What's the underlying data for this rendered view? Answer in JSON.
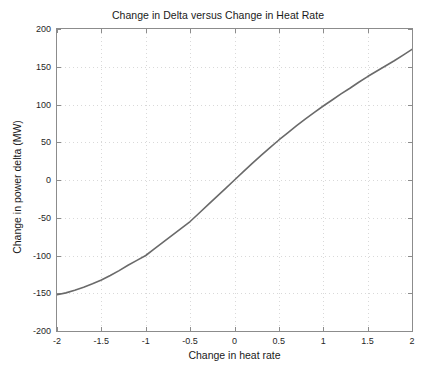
{
  "chart_data": {
    "type": "line",
    "title": "Change in Delta versus Change in Heat Rate",
    "xlabel": "Change in heat rate",
    "ylabel": "Change in power delta (MW)",
    "xlim": [
      -2,
      2
    ],
    "ylim": [
      -200,
      200
    ],
    "xticks": [
      -2,
      -1.5,
      -1,
      -0.5,
      0,
      0.5,
      1,
      1.5,
      2
    ],
    "yticks": [
      -200,
      -150,
      -100,
      -50,
      0,
      50,
      100,
      150,
      200
    ],
    "xtick_labels": [
      "-2",
      "-1.5",
      "-1",
      "-0.5",
      "0",
      "0.5",
      "1",
      "1.5",
      "2"
    ],
    "ytick_labels": [
      "-200",
      "-150",
      "-100",
      "-50",
      "0",
      "50",
      "100",
      "150",
      "200"
    ],
    "grid": true,
    "grid_style": "dotted",
    "legend": null,
    "line_color": "#6a6a6a",
    "axis_color": "#8c8c8c",
    "grid_color": "#d9d9d9",
    "background": "#ffffff",
    "series": [
      {
        "name": "Change in power delta",
        "x": [
          -2,
          -1.9,
          -1.8,
          -1.7,
          -1.6,
          -1.5,
          -1.4,
          -1.3,
          -1.2,
          -1.1,
          -1,
          -0.9,
          -0.8,
          -0.7,
          -0.6,
          -0.5,
          -0.4,
          -0.3,
          -0.2,
          -0.1,
          0,
          0.1,
          0.2,
          0.3,
          0.4,
          0.5,
          0.6,
          0.7,
          0.8,
          0.9,
          1,
          1.1,
          1.2,
          1.3,
          1.4,
          1.5,
          1.6,
          1.7,
          1.8,
          1.9,
          2
        ],
        "values": [
          -152,
          -149.5,
          -146,
          -142,
          -137.5,
          -132.5,
          -126.5,
          -120,
          -113,
          -106.5,
          -100,
          -91,
          -82,
          -73,
          -64,
          -55,
          -44,
          -33,
          -22,
          -11,
          0,
          11,
          22,
          32.5,
          43,
          53,
          62.5,
          72,
          81,
          89.5,
          98,
          106,
          114,
          121.5,
          129.5,
          137,
          144,
          151,
          158,
          165.5,
          173
        ]
      }
    ]
  },
  "axes": {
    "ylabel_text": "Change in power delta (MW)",
    "xlabel_text": "Change in heat rate"
  }
}
